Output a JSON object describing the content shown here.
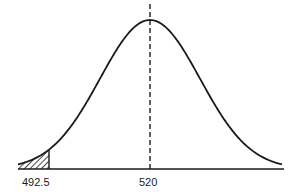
{
  "diagram": {
    "type": "normal-distribution-curve",
    "mean_label": "520",
    "cutoff_label": "492.5",
    "shaded_region": "left-tail",
    "colors": {
      "line": "#1a1a1a",
      "background": "#ffffff"
    }
  }
}
